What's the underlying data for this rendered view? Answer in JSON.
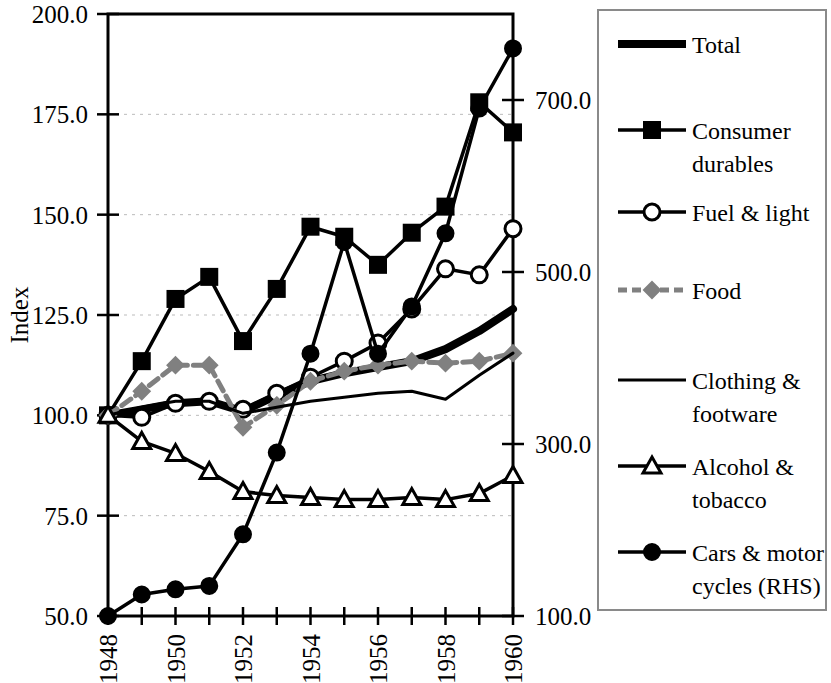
{
  "chart_data": {
    "type": "line",
    "title": "",
    "xlabel": "",
    "ylabel": "Index",
    "y_axis_label": "Index",
    "x": [
      1948,
      1949,
      1950,
      1951,
      1952,
      1953,
      1954,
      1955,
      1956,
      1957,
      1958,
      1959,
      1960
    ],
    "xlim": [
      1948,
      1960
    ],
    "xtick_labels": [
      "1948",
      "1950",
      "1952",
      "1954",
      "1956",
      "1958",
      "1960"
    ],
    "xtick_values": [
      1948,
      1950,
      1952,
      1954,
      1956,
      1958,
      1960
    ],
    "ylim": [
      50.0,
      200.0
    ],
    "ytick_labels": [
      "50.0",
      "75.0",
      "100.0",
      "125.0",
      "150.0",
      "175.0",
      "200.0"
    ],
    "ytick_values": [
      50.0,
      75.0,
      100.0,
      125.0,
      150.0,
      175.0,
      200.0
    ],
    "y2lim": [
      100.0,
      800.0
    ],
    "y2tick_labels": [
      "100.0",
      "300.0",
      "500.0",
      "700.0"
    ],
    "y2tick_values": [
      100.0,
      300.0,
      500.0,
      700.0
    ],
    "grid": true,
    "legend_position": "right",
    "series": [
      {
        "name": "Total",
        "axis": "left",
        "marker": "none",
        "style": "solid-thick",
        "color": "#000000",
        "values": [
          100.0,
          101.5,
          103.0,
          103.5,
          101.0,
          105.0,
          108.5,
          110.5,
          112.0,
          113.5,
          116.5,
          121.0,
          126.5
        ]
      },
      {
        "name": "Consumer durables",
        "axis": "left",
        "marker": "square",
        "style": "solid",
        "color": "#000000",
        "values": [
          100.0,
          113.5,
          129.0,
          134.5,
          118.5,
          131.5,
          147.0,
          144.5,
          137.5,
          145.5,
          152.0,
          178.0,
          170.5
        ]
      },
      {
        "name": "Fuel & light",
        "axis": "left",
        "marker": "circle-open",
        "style": "solid",
        "color": "#000000",
        "values": [
          100.0,
          99.5,
          103.0,
          103.5,
          101.5,
          105.5,
          109.5,
          113.5,
          118.0,
          126.5,
          136.5,
          135.0,
          146.5
        ]
      },
      {
        "name": "Food",
        "axis": "left",
        "marker": "diamond",
        "style": "dashed",
        "color": "#808080",
        "values": [
          100.0,
          106.0,
          112.5,
          112.5,
          97.0,
          102.5,
          108.5,
          111.0,
          112.5,
          113.5,
          113.0,
          113.5,
          115.5
        ]
      },
      {
        "name": "Clothing & footware",
        "axis": "left",
        "marker": "none",
        "style": "solid-thin",
        "color": "#000000",
        "values": [
          100.0,
          102.0,
          103.5,
          103.5,
          100.5,
          102.0,
          103.5,
          104.5,
          105.5,
          106.0,
          104.0,
          110.0,
          115.5
        ]
      },
      {
        "name": "Alcohol & tobacco",
        "axis": "left",
        "marker": "triangle-open",
        "style": "solid",
        "color": "#000000",
        "values": [
          100.0,
          93.5,
          90.5,
          86.0,
          81.0,
          80.0,
          79.5,
          79.0,
          79.0,
          79.5,
          79.0,
          80.5,
          85.0
        ]
      },
      {
        "name": "Cars & motor cycles (RHS)",
        "axis": "right",
        "marker": "circle-filled",
        "style": "solid",
        "color": "#000000",
        "values": [
          100.0,
          125.0,
          131.0,
          135.0,
          195.0,
          290.0,
          405.0,
          535.0,
          405.0,
          460.0,
          545.0,
          690.0,
          760.0
        ],
        "values_left_scale": [
          50.0,
          55.0,
          56.5,
          57.5,
          70.5,
          93.5,
          113.0,
          129.0,
          112.0,
          120.0,
          134.5,
          176.0,
          190.0
        ]
      }
    ]
  },
  "legend": {
    "items": [
      {
        "label": "Total",
        "label2": ""
      },
      {
        "label": "Consumer",
        "label2": "durables"
      },
      {
        "label": "Fuel & light",
        "label2": ""
      },
      {
        "label": "Food",
        "label2": ""
      },
      {
        "label": "Clothing &",
        "label2": "footware"
      },
      {
        "label": "Alcohol &",
        "label2": "tobacco"
      },
      {
        "label": "Cars & motor",
        "label2": "cycles (RHS)"
      }
    ]
  }
}
